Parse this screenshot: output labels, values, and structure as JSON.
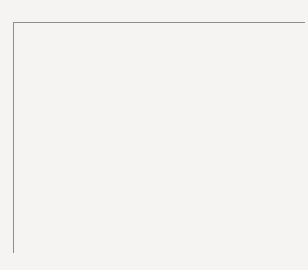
{
  "top_column_labels": [
    "1",
    "2",
    "3",
    "4",
    "5",
    "6",
    "7",
    "8",
    "9",
    "10",
    "11",
    "12",
    "13",
    "14",
    "15",
    "16"
  ],
  "bottom_column_labels": [
    "17",
    "18",
    "19",
    "20",
    "21",
    "22",
    "23",
    "24",
    "25",
    "26",
    "27",
    "28",
    "29",
    "30",
    "31",
    "32"
  ],
  "row_labels": [
    "D0",
    "D1",
    "D2",
    "D3",
    "D4",
    "D5",
    "D6",
    "D7",
    "D0",
    "D1",
    "D2",
    "D3",
    "D4",
    "D5",
    "D6",
    "D7"
  ],
  "colors": {
    "filled": "#111111",
    "grid_line": "#9a9a9a",
    "background": "#f5f4f2"
  },
  "filled_cells_top": {
    "D0": [
      10
    ],
    "D1": [
      1,
      2,
      10
    ],
    "D2": [
      3,
      4,
      10
    ],
    "D3": [
      4,
      6,
      7,
      8,
      9,
      10,
      11,
      12,
      13,
      14
    ],
    "D4": [
      6,
      10,
      14
    ],
    "D5": [
      6,
      10,
      13
    ],
    "D6": [
      2,
      6,
      10
    ],
    "D7": [
      5,
      6,
      7,
      8,
      9,
      10,
      11,
      12,
      13
    ]
  },
  "filled_cells_bottom": {
    "D0": [
      20,
      22,
      29
    ],
    "D1": [
      19,
      22,
      24,
      28
    ],
    "D2": [
      17,
      18,
      19,
      22,
      25,
      27
    ],
    "D3": [
      19,
      22,
      26
    ],
    "D4": [
      19,
      21,
      25,
      27
    ],
    "D5": [
      19,
      21,
      24,
      28
    ],
    "D6": [
      19,
      20,
      23,
      29,
      30,
      31
    ],
    "D7": [
      19,
      22,
      30
    ]
  },
  "grid_rows": [
    [
      0,
      0,
      0,
      0,
      0,
      0,
      0,
      0,
      0,
      1,
      0,
      0,
      0,
      0,
      0,
      0
    ],
    [
      1,
      1,
      0,
      0,
      0,
      0,
      0,
      0,
      0,
      1,
      0,
      0,
      0,
      0,
      0,
      0
    ],
    [
      0,
      0,
      1,
      1,
      0,
      0,
      0,
      0,
      0,
      1,
      0,
      0,
      0,
      0,
      0,
      0
    ],
    [
      0,
      0,
      0,
      1,
      0,
      1,
      1,
      1,
      1,
      1,
      1,
      1,
      1,
      1,
      0,
      0
    ],
    [
      0,
      0,
      0,
      0,
      0,
      1,
      0,
      0,
      0,
      1,
      0,
      0,
      0,
      1,
      0,
      0
    ],
    [
      0,
      0,
      0,
      0,
      0,
      1,
      0,
      0,
      0,
      1,
      0,
      0,
      1,
      0,
      0,
      0
    ],
    [
      0,
      1,
      0,
      0,
      0,
      1,
      0,
      0,
      0,
      1,
      0,
      0,
      0,
      0,
      0,
      0
    ],
    [
      0,
      0,
      0,
      0,
      1,
      1,
      1,
      1,
      1,
      1,
      1,
      1,
      1,
      0,
      0,
      0
    ],
    [
      0,
      0,
      0,
      1,
      0,
      1,
      0,
      0,
      0,
      0,
      0,
      0,
      1,
      0,
      0,
      0
    ],
    [
      0,
      0,
      1,
      0,
      0,
      1,
      0,
      1,
      0,
      0,
      0,
      1,
      0,
      0,
      0,
      0
    ],
    [
      1,
      1,
      1,
      0,
      0,
      1,
      0,
      0,
      1,
      0,
      1,
      0,
      0,
      0,
      0,
      0
    ],
    [
      0,
      0,
      1,
      0,
      0,
      1,
      0,
      0,
      0,
      1,
      0,
      0,
      0,
      0,
      0,
      0
    ],
    [
      0,
      0,
      1,
      0,
      1,
      0,
      0,
      0,
      1,
      0,
      1,
      0,
      0,
      0,
      0,
      0
    ],
    [
      0,
      0,
      1,
      0,
      1,
      0,
      0,
      1,
      0,
      0,
      0,
      1,
      0,
      0,
      0,
      0
    ],
    [
      0,
      0,
      1,
      1,
      0,
      0,
      1,
      0,
      0,
      0,
      0,
      0,
      1,
      1,
      1,
      0
    ],
    [
      0,
      0,
      1,
      0,
      0,
      1,
      0,
      0,
      0,
      0,
      0,
      0,
      0,
      1,
      0,
      0
    ]
  ]
}
